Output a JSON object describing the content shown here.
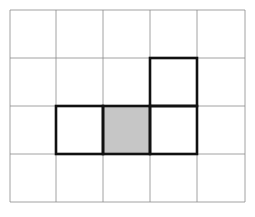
{
  "diagram": {
    "type": "grid-polyomino",
    "columns": 5,
    "rows": 4,
    "origin": {
      "x": 10,
      "y": 10
    },
    "col_edges": [
      10,
      56,
      103,
      150,
      197,
      245
    ],
    "row_edges": [
      10,
      58,
      106,
      154,
      202
    ],
    "grid_line_color": "#8a8a8a",
    "outline_color": "#111111",
    "shade_color": "#c6c6c6",
    "background": "#ffffff",
    "outlined_cells": [
      {
        "row": 1,
        "col": 3,
        "shaded": false
      },
      {
        "row": 2,
        "col": 1,
        "shaded": false
      },
      {
        "row": 2,
        "col": 2,
        "shaded": true
      },
      {
        "row": 2,
        "col": 3,
        "shaded": false
      }
    ]
  }
}
